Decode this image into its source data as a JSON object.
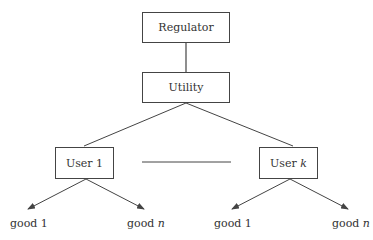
{
  "nodes": {
    "regulator": "Regulator",
    "utility": "Utility",
    "user1": {
      "prefix": "User ",
      "suffix": "1"
    },
    "userk": {
      "prefix": "User ",
      "suffix": "k"
    }
  },
  "leaves": [
    {
      "prefix": "good ",
      "suffix": "1"
    },
    {
      "prefix": "good ",
      "suffix": "n"
    },
    {
      "prefix": "good ",
      "suffix": "1"
    },
    {
      "prefix": "good ",
      "suffix": "n"
    }
  ],
  "colors": {
    "stroke": "#444444",
    "text": "#333333"
  }
}
